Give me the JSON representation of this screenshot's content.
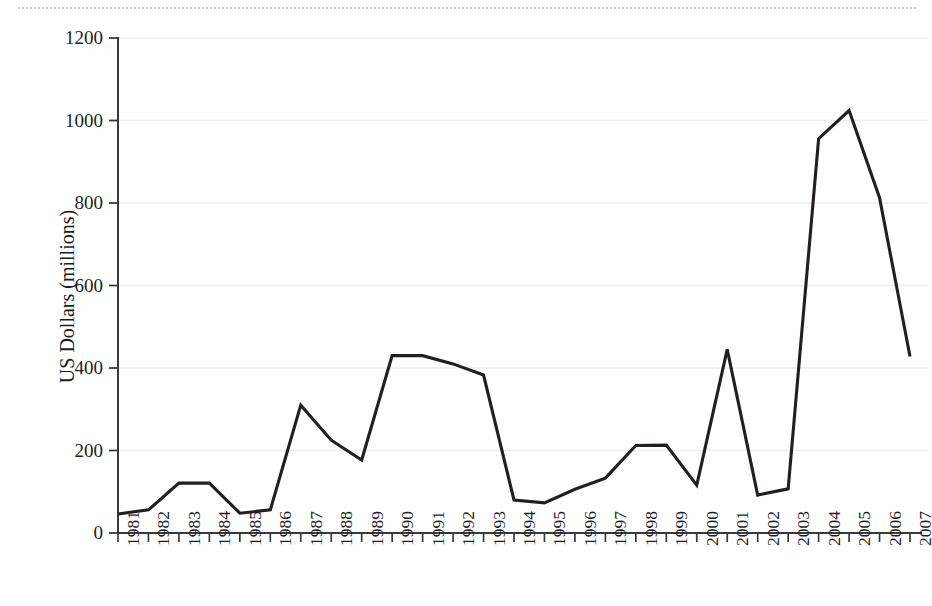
{
  "chart_data": {
    "type": "line",
    "title": "",
    "subtitle": "",
    "xlabel": "",
    "ylabel": "US Dollars (millions)",
    "categories": [
      "1981",
      "1982",
      "1983",
      "1984",
      "1985",
      "1986",
      "1987",
      "1988",
      "1989",
      "1990",
      "1991",
      "1992",
      "1993",
      "1994",
      "1995",
      "1996",
      "1997",
      "1998",
      "1999",
      "2000",
      "2001",
      "2002",
      "2003",
      "2004",
      "2005",
      "2006",
      "2007"
    ],
    "values": [
      46,
      56,
      121,
      121,
      48,
      56,
      310,
      225,
      177,
      430,
      430,
      410,
      383,
      80,
      73,
      106,
      133,
      212,
      213,
      116,
      445,
      92,
      107,
      956,
      1024,
      813,
      428
    ],
    "ylim": [
      0,
      1200
    ],
    "yticks": [
      0,
      200,
      400,
      600,
      800,
      1000,
      1200
    ],
    "ytick_labels": [
      "0",
      "200",
      "400",
      "600",
      "800",
      "1000",
      "1200"
    ],
    "grid": true,
    "grid_axis": "y",
    "legend": false,
    "legend_position": "none",
    "line_color": "#231f20",
    "line_width": 3.1,
    "axis_color": "#3a3a3c",
    "grid_color": "#ececf1",
    "background": "#ffffff",
    "xtick_rotation": -90
  },
  "axes": {
    "y_axis_title": "US Dollars (millions)"
  },
  "decoration": {
    "top_rule_style": "dotted",
    "top_rule_color": "#c9c9cf"
  }
}
